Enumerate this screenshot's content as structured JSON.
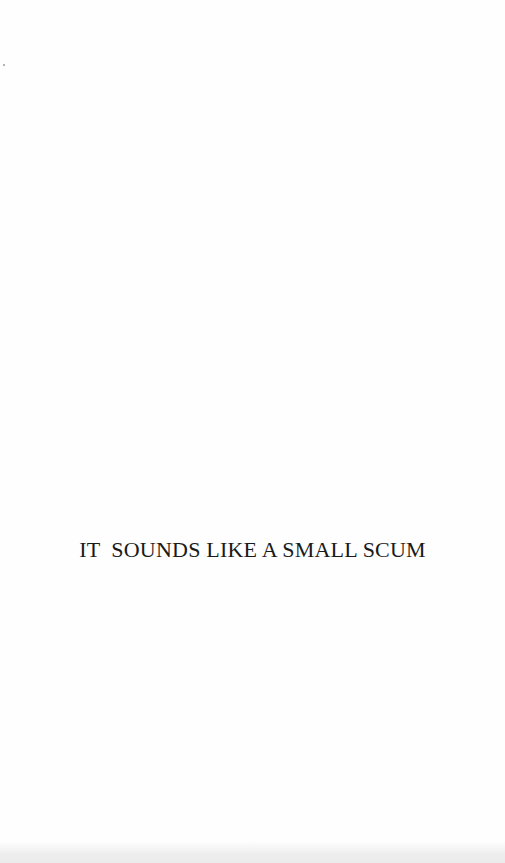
{
  "page": {
    "type": "half-title page",
    "title": "IT  SOUNDS LIKE A SMALL SCUM"
  },
  "colors": {
    "paper": "#fefefe",
    "ink": "#1a1a1a"
  }
}
